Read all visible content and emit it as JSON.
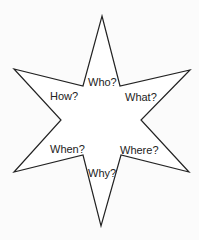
{
  "diagram": {
    "shape": "six-pointed star",
    "stroke_color": "#222222",
    "fill_color": "#ffffff",
    "background_color": "#fbfbfb",
    "points": "102,16 120,86 190,70 141,120 189,172 121,155 101,226 83,155 14,172 61,120 14,69 83,86",
    "labels": [
      {
        "id": "who",
        "text": "Who?",
        "x": 88,
        "y": 86
      },
      {
        "id": "how",
        "text": "How?",
        "x": 50,
        "y": 100
      },
      {
        "id": "what",
        "text": "What?",
        "x": 125,
        "y": 101
      },
      {
        "id": "when",
        "text": "When?",
        "x": 50,
        "y": 153
      },
      {
        "id": "where",
        "text": "Where?",
        "x": 120,
        "y": 154
      },
      {
        "id": "why",
        "text": "Why?",
        "x": 88,
        "y": 177
      }
    ]
  }
}
